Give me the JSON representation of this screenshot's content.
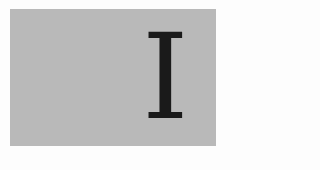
{
  "part_marker": {
    "numeral": "I",
    "panel_color": "#b9b9b9",
    "text_color": "#1a1a1a"
  }
}
